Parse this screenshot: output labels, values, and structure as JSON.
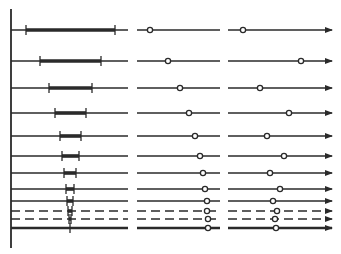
{
  "figure": {
    "width": 341,
    "height": 254,
    "background": "#ffffff",
    "ink": "#2a2a2a",
    "axis": {
      "x": 11,
      "y_top": 9,
      "y_bottom": 248
    },
    "columns": {
      "left": {
        "x_start": 11,
        "x_end": 128
      },
      "middle": {
        "x_start": 137,
        "x_end": 220
      },
      "right": {
        "x_start": 228,
        "x_end": 332,
        "arrow": true
      }
    },
    "rows": [
      {
        "y": 30,
        "style": "solid",
        "weight": 1.4,
        "bar_start": 26,
        "bar_end": 115,
        "mid_marker": 150,
        "right_marker": 243
      },
      {
        "y": 61,
        "style": "solid",
        "weight": 1.4,
        "bar_start": 40,
        "bar_end": 101,
        "mid_marker": 168,
        "right_marker": 301
      },
      {
        "y": 88,
        "style": "solid",
        "weight": 1.4,
        "bar_start": 49,
        "bar_end": 92,
        "mid_marker": 180,
        "right_marker": 260
      },
      {
        "y": 113,
        "style": "solid",
        "weight": 1.4,
        "bar_start": 55,
        "bar_end": 86,
        "mid_marker": 189,
        "right_marker": 289
      },
      {
        "y": 136,
        "style": "solid",
        "weight": 1.4,
        "bar_start": 60,
        "bar_end": 81,
        "mid_marker": 195,
        "right_marker": 267
      },
      {
        "y": 156,
        "style": "solid",
        "weight": 1.4,
        "bar_start": 62,
        "bar_end": 79,
        "mid_marker": 200,
        "right_marker": 284
      },
      {
        "y": 173,
        "style": "solid",
        "weight": 1.4,
        "bar_start": 64,
        "bar_end": 76,
        "mid_marker": 203,
        "right_marker": 270
      },
      {
        "y": 189,
        "style": "solid",
        "weight": 1.4,
        "bar_start": 66,
        "bar_end": 74,
        "mid_marker": 205,
        "right_marker": 280
      },
      {
        "y": 201,
        "style": "solid",
        "weight": 1.4,
        "bar_start": 67,
        "bar_end": 73,
        "mid_marker": 207,
        "right_marker": 273
      },
      {
        "y": 211,
        "style": "dashed",
        "weight": 1.4,
        "bar_start": 68,
        "bar_end": 72,
        "mid_marker": 207,
        "right_marker": 277
      },
      {
        "y": 219,
        "style": "dashed",
        "weight": 1.4,
        "bar_start": 69,
        "bar_end": 71,
        "mid_marker": 208,
        "right_marker": 275
      },
      {
        "y": 228,
        "style": "solid",
        "weight": 2.6,
        "bar_start": 70,
        "bar_end": 70,
        "mid_marker": 208,
        "right_marker": 276
      }
    ]
  }
}
